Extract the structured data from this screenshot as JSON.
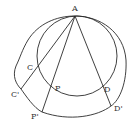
{
  "diagram": {
    "type": "geometric-figure",
    "points": [
      {
        "id": "A",
        "label": "A",
        "x": 75,
        "y": 16,
        "lx": 72,
        "ly": 11
      },
      {
        "id": "C",
        "label": "C",
        "x": 37,
        "y": 70,
        "lx": 27,
        "ly": 70
      },
      {
        "id": "Cp",
        "label": "C'",
        "x": 21,
        "y": 89,
        "lx": 11,
        "ly": 97
      },
      {
        "id": "P",
        "label": "P",
        "x": 52,
        "y": 87,
        "lx": 55,
        "ly": 91
      },
      {
        "id": "Pp",
        "label": "P'",
        "x": 42,
        "y": 112,
        "lx": 31,
        "ly": 119
      },
      {
        "id": "D",
        "label": "D",
        "x": 100,
        "y": 87,
        "lx": 104,
        "ly": 92
      },
      {
        "id": "Dp",
        "label": "D'",
        "x": 111,
        "y": 106,
        "lx": 114,
        "ly": 111
      }
    ],
    "inner_circle": {
      "cx": 77,
      "cy": 56,
      "r": 40
    },
    "rays": [
      {
        "from": "A",
        "to": "Cp",
        "through": "C"
      },
      {
        "from": "A",
        "to": "Pp",
        "through": "P"
      },
      {
        "from": "A",
        "to": "Dp",
        "through": "D"
      }
    ],
    "outer_curve_description": "closed irregular curve passing through A, C', P', D'"
  }
}
